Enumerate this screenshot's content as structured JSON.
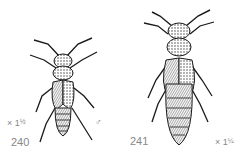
{
  "figures": [
    {
      "number": "240",
      "scale": "× 1",
      "scale_fraction": "½",
      "sex_symbol": "♂"
    },
    {
      "number": "241",
      "scale": "× 1",
      "scale_fraction": "¼"
    }
  ],
  "colors": {
    "ink": "#1a1a1a",
    "shade": "#555555",
    "label": "#888888",
    "background": "#ffffff"
  }
}
